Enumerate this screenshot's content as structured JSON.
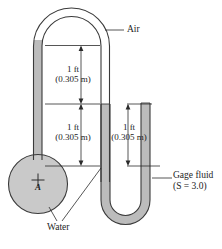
{
  "figure": {
    "type": "manometer-diagram"
  },
  "labels": {
    "air": "Air",
    "water": "Water",
    "gage_fluid_line1": "Gage fluid",
    "gage_fluid_line2": "(S  =  3.0)",
    "point_a": "A"
  },
  "dimensions": [
    {
      "id": "upper",
      "value": "1 ft",
      "metric": "(0.305 m)"
    },
    {
      "id": "middle",
      "value": "1 ft",
      "metric": "(0.305 m)"
    },
    {
      "id": "right",
      "value": "1 ft",
      "metric": "(0.305 m)"
    }
  ],
  "colors": {
    "fluid_fill": "#b9b9b9",
    "pipe_fill": "#c6c6c6",
    "outline": "#3a3a3a",
    "text": "#1d1d1d",
    "background": "#ffffff"
  }
}
